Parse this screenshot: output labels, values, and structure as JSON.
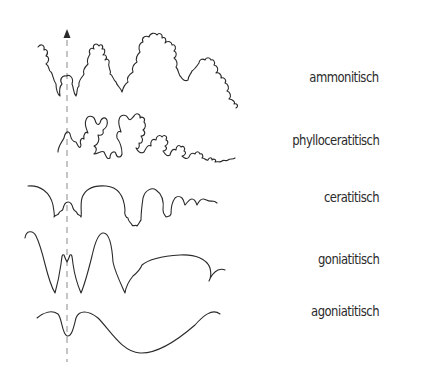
{
  "diagram": {
    "type": "suture-line-types",
    "axis": {
      "style": "dashed",
      "direction": "up",
      "arrow": "arrow-up-icon",
      "x": 67
    },
    "rows": [
      {
        "id": "ammonitisch",
        "label": "ammonitisch",
        "style": "deeply-frilled saddles and lobes"
      },
      {
        "id": "phylloceratitisch",
        "label": "phylloceratitisch",
        "style": "leaf-shaped frilled saddles"
      },
      {
        "id": "ceratitisch",
        "label": "ceratitisch",
        "style": "smooth saddles, serrated lobes"
      },
      {
        "id": "goniatitisch",
        "label": "goniatitisch",
        "style": "pointed lobes, rounded saddles"
      },
      {
        "id": "agoniatitisch",
        "label": "agoniatitisch",
        "style": "gentle undulation"
      }
    ],
    "colors": {
      "line": "#2a2a2a",
      "dash": "#8a8a8a",
      "text": "#2b2b2b",
      "background": "#ffffff"
    }
  }
}
